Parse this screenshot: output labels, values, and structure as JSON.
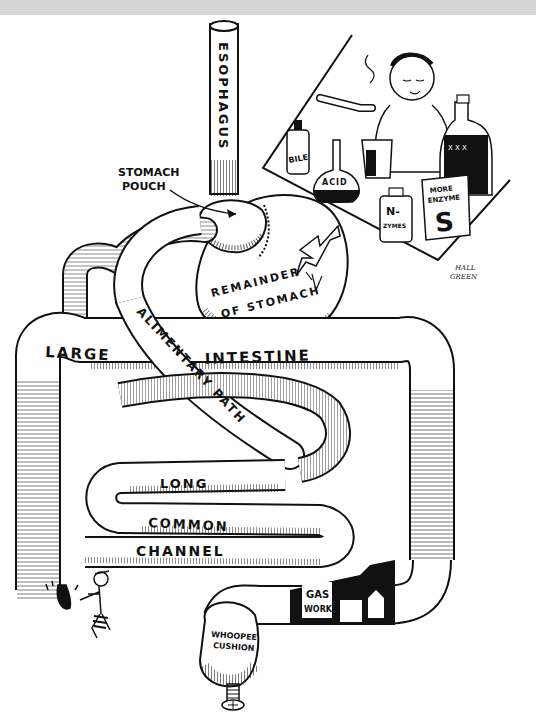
{
  "figure": {
    "type": "cartoon-diagram",
    "background": "#ffffff",
    "top_strip_color": "#d6d6d6",
    "ink_color": "#111111"
  },
  "labels": {
    "esophagus": "ESOPHAGUS",
    "stomach_pouch_line1": "STOMACH",
    "stomach_pouch_line2": "POUCH",
    "remainder_line1": "REMAINDER",
    "remainder_line2": "OF STOMACH",
    "large": "LARGE",
    "intestine": "INTESTINE",
    "alimentary_path": "ALIMENTARY PATH",
    "long": "LONG",
    "common": "COMMON",
    "channel": "CHANNEL",
    "gas_line1": "GAS",
    "gas_line2": "WORKS",
    "whoopee_line1": "WHOOPEE",
    "whoopee_line2": "CUSHION"
  },
  "inset": {
    "bottles": {
      "bile": "BILE",
      "acid": "ACID",
      "nzymes_line1": "N-",
      "nzymes_line2": "ZYMES",
      "jug_marks": "X X X",
      "box_line1": "MORE",
      "box_line2": "ENZYME",
      "box_big": "S"
    }
  },
  "signature": {
    "line1": "HALL",
    "line2": "GREEN"
  }
}
